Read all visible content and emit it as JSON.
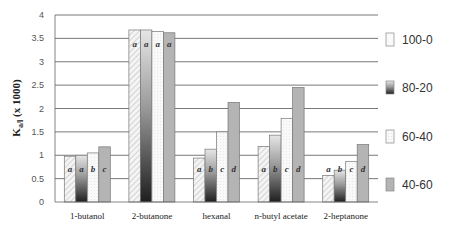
{
  "chart_data": {
    "type": "bar",
    "title": "",
    "xlabel": "",
    "ylabel": "K_a/l (x 1000)",
    "ylim": [
      0,
      4
    ],
    "yticks": [
      "0",
      "0.5",
      "1",
      "1.5",
      "2",
      "2.5",
      "3",
      "3.5",
      "4"
    ],
    "grid": true,
    "legend_position": "right",
    "categories": [
      "1-butanol",
      "2-butanone",
      "hexanal",
      "n-butyl acetate",
      "2-heptanone"
    ],
    "series": [
      {
        "name": "100-0",
        "values": [
          0.98,
          3.68,
          0.94,
          1.19,
          0.57
        ],
        "letters": [
          "a",
          "a",
          "a",
          "a",
          "a"
        ],
        "fill": "hatch"
      },
      {
        "name": "80-20",
        "values": [
          1.0,
          3.68,
          1.13,
          1.43,
          0.68
        ],
        "letters": [
          "a",
          "a",
          "b",
          "b",
          "b"
        ],
        "fill": "dark-gradient"
      },
      {
        "name": "60-40",
        "values": [
          1.05,
          3.65,
          1.5,
          1.79,
          0.87
        ],
        "letters": [
          "b",
          "a",
          "c",
          "c",
          "c"
        ],
        "fill": "light-dotted"
      },
      {
        "name": "40-60",
        "values": [
          1.18,
          3.62,
          2.13,
          2.45,
          1.23
        ],
        "letters": [
          "c",
          "a",
          "d",
          "d",
          "d"
        ],
        "fill": "gray"
      }
    ]
  },
  "axis": {
    "ylabel_main": "K",
    "ylabel_sub": "a/l",
    "ylabel_tail": " (x 1000)"
  },
  "legend": [
    {
      "label": "100-0"
    },
    {
      "label": "80-20"
    },
    {
      "label": "60-40"
    },
    {
      "label": "40-60"
    }
  ]
}
